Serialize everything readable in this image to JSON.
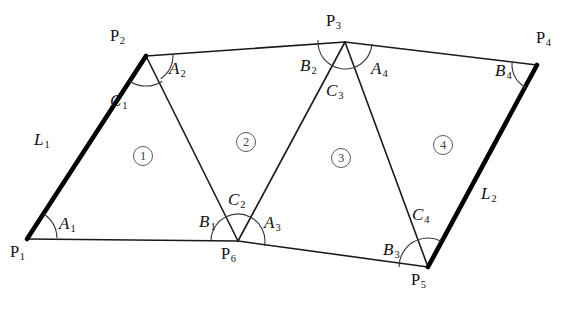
{
  "figure": {
    "type": "geometric-diagram",
    "background_color": "#ffffff",
    "line_color": "#1a1a1a",
    "thick_line_color": "#000000"
  },
  "vertices": [
    {
      "id": "P1",
      "label": "P",
      "sub": "1",
      "x": 27,
      "y": 239,
      "label_x": 10,
      "label_y": 244
    },
    {
      "id": "P2",
      "label": "P",
      "sub": "2",
      "x": 146,
      "y": 56,
      "label_x": 110,
      "label_y": 28
    },
    {
      "id": "P3",
      "label": "P",
      "sub": "3",
      "x": 345,
      "y": 42,
      "label_x": 326,
      "label_y": 13
    },
    {
      "id": "P4",
      "label": "P",
      "sub": "4",
      "x": 537,
      "y": 65,
      "label_x": 536,
      "label_y": 30
    },
    {
      "id": "P5",
      "label": "P",
      "sub": "5",
      "x": 428,
      "y": 267,
      "label_x": 411,
      "label_y": 272
    },
    {
      "id": "P6",
      "label": "P",
      "sub": "6",
      "x": 238,
      "y": 241,
      "label_x": 221,
      "label_y": 246
    }
  ],
  "edges": [
    {
      "name": "L1",
      "from": "P1",
      "to": "P2",
      "weight": "thick"
    },
    {
      "name": "P2-P3",
      "from": "P2",
      "to": "P3",
      "weight": "thin"
    },
    {
      "name": "P3-P4",
      "from": "P3",
      "to": "P4",
      "weight": "thin"
    },
    {
      "name": "L2",
      "from": "P4",
      "to": "P5",
      "weight": "thick"
    },
    {
      "name": "P5-P6",
      "from": "P5",
      "to": "P6",
      "weight": "thin"
    },
    {
      "name": "P6-P1",
      "from": "P6",
      "to": "P1",
      "weight": "thin"
    },
    {
      "name": "P2-P6",
      "from": "P2",
      "to": "P6",
      "weight": "thin"
    },
    {
      "name": "P3-P6",
      "from": "P3",
      "to": "P6",
      "weight": "thin"
    },
    {
      "name": "P3-P5",
      "from": "P3",
      "to": "P5",
      "weight": "thin"
    }
  ],
  "edge_labels": [
    {
      "id": "L1",
      "label": "L",
      "sub": "1",
      "x": 34,
      "y": 131
    },
    {
      "id": "L2",
      "label": "L",
      "sub": "2",
      "x": 481,
      "y": 185
    }
  ],
  "triangles": [
    {
      "number": "1",
      "marker": "①",
      "vertices": [
        "P1",
        "P2",
        "P6"
      ],
      "angles": [
        "A1",
        "C1",
        "B1"
      ],
      "x": 133,
      "y": 146
    },
    {
      "number": "2",
      "marker": "②",
      "vertices": [
        "P6",
        "P2",
        "P3"
      ],
      "angles": [
        "C2",
        "A2",
        "B2"
      ],
      "x": 236,
      "y": 132
    },
    {
      "number": "3",
      "marker": "③",
      "vertices": [
        "P6",
        "P3",
        "P5"
      ],
      "angles": [
        "A3",
        "C3",
        "B3"
      ],
      "x": 331,
      "y": 148
    },
    {
      "number": "4",
      "marker": "④",
      "vertices": [
        "P5",
        "P3",
        "P4"
      ],
      "angles": [
        "C4",
        "A4",
        "B4"
      ],
      "x": 433,
      "y": 135
    }
  ],
  "angles": [
    {
      "id": "A1",
      "label": "A",
      "sub": "1",
      "at_vertex": "P1",
      "triangle": "1",
      "x": 59,
      "y": 215,
      "arc": {
        "cx": 27,
        "cy": 239,
        "r": 30,
        "start": -57,
        "end": -2
      }
    },
    {
      "id": "C1",
      "label": "C",
      "sub": "1",
      "at_vertex": "P2",
      "triangle": "1",
      "x": 110,
      "y": 92,
      "arc": {
        "cx": 146,
        "cy": 56,
        "r": 30,
        "start": 57,
        "end": 123
      }
    },
    {
      "id": "B1",
      "label": "B",
      "sub": "1",
      "at_vertex": "P6",
      "triangle": "1",
      "x": 199,
      "y": 213,
      "arc": {
        "cx": 238,
        "cy": 241,
        "r": 27,
        "start": 180,
        "end": 244
      }
    },
    {
      "id": "A2",
      "label": "A",
      "sub": "2",
      "at_vertex": "P2",
      "triangle": "2",
      "x": 169,
      "y": 60,
      "arc": {
        "cx": 146,
        "cy": 56,
        "r": 27,
        "start": -3,
        "end": 57
      }
    },
    {
      "id": "C2",
      "label": "C",
      "sub": "2",
      "at_vertex": "P6",
      "triangle": "2",
      "x": 228,
      "y": 191,
      "arc": {
        "cx": 238,
        "cy": 241,
        "r": 27,
        "start": 244,
        "end": 297
      }
    },
    {
      "id": "B2",
      "label": "B",
      "sub": "2",
      "at_vertex": "P3",
      "triangle": "2",
      "x": 300,
      "y": 57,
      "arc": {
        "cx": 345,
        "cy": 42,
        "r": 27,
        "start": 97,
        "end": 184
      }
    },
    {
      "id": "A3",
      "label": "A",
      "sub": "3",
      "at_vertex": "P6",
      "triangle": "3",
      "x": 264,
      "y": 214,
      "arc": {
        "cx": 238,
        "cy": 241,
        "r": 27,
        "start": 297,
        "end": 371
      }
    },
    {
      "id": "C3",
      "label": "C",
      "sub": "3",
      "at_vertex": "P3",
      "triangle": "3",
      "x": 326,
      "y": 82,
      "arc": {
        "cx": 345,
        "cy": 42,
        "r": 27,
        "start": 72,
        "end": 97
      }
    },
    {
      "id": "B3",
      "label": "B",
      "sub": "3",
      "at_vertex": "P5",
      "triangle": "3",
      "x": 383,
      "y": 241,
      "arc": {
        "cx": 428,
        "cy": 267,
        "r": 29,
        "start": 180,
        "end": 259
      }
    },
    {
      "id": "A4",
      "label": "A",
      "sub": "4",
      "at_vertex": "P3",
      "triangle": "4",
      "x": 371,
      "y": 60,
      "arc": {
        "cx": 345,
        "cy": 42,
        "r": 27,
        "start": 4,
        "end": 72
      }
    },
    {
      "id": "B4",
      "label": "B",
      "sub": "4",
      "at_vertex": "P4",
      "triangle": "4",
      "x": 495,
      "y": 62,
      "arc": {
        "cx": 537,
        "cy": 65,
        "r": 25,
        "start": 118,
        "end": 185
      }
    },
    {
      "id": "C4",
      "label": "C",
      "sub": "4",
      "at_vertex": "P5",
      "triangle": "4",
      "x": 412,
      "y": 206,
      "arc": {
        "cx": 428,
        "cy": 267,
        "r": 29,
        "start": 259,
        "end": 297
      }
    }
  ]
}
